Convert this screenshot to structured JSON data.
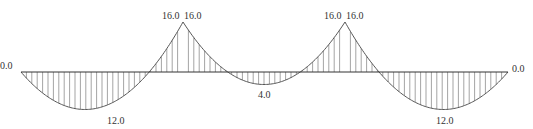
{
  "chart_data": {
    "type": "line",
    "title": "",
    "units": "",
    "spans": [
      {
        "name": "span-1",
        "left_moment": 0.0,
        "right_moment": -16.0,
        "max_sagging": 12.0
      },
      {
        "name": "span-2",
        "left_moment": -16.0,
        "right_moment": -16.0,
        "max_sagging": 4.0
      },
      {
        "name": "span-3",
        "left_moment": -16.0,
        "right_moment": 0.0,
        "max_sagging": 12.0
      }
    ],
    "support_values": [
      0.0,
      -16.0,
      -16.0,
      0.0
    ],
    "labels": {
      "support_a": "0.0",
      "support_b_left": "16.0",
      "support_b_right": "16.0",
      "support_c_left": "16.0",
      "support_c_right": "16.0",
      "support_d": "0.0",
      "span_1_max": "12.0",
      "span_2_max": "4.0",
      "span_3_max": "12.0"
    }
  },
  "colors": {
    "line": "#333333",
    "hatch": "#666666",
    "text": "#333333",
    "background": "#ffffff"
  }
}
